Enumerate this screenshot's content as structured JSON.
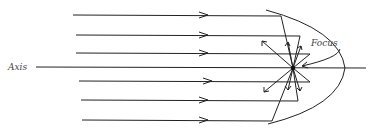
{
  "diagram": {
    "labels": {
      "axis": "Axis",
      "focus": "Focus"
    },
    "colors": {
      "line": "#222222",
      "background": "#ffffff",
      "label": "#444444"
    },
    "rays": [
      {
        "y": 15,
        "x_start": 73
      },
      {
        "y": 35,
        "x_start": 76
      },
      {
        "y": 53,
        "x_start": 76
      },
      {
        "y": 81,
        "x_start": 79
      },
      {
        "y": 100,
        "x_start": 81
      },
      {
        "y": 120,
        "x_start": 82
      }
    ],
    "axis_line": {
      "y": 67,
      "x_start": 36,
      "x_end": 366
    },
    "focus_point": {
      "x": 293,
      "y": 68
    }
  }
}
